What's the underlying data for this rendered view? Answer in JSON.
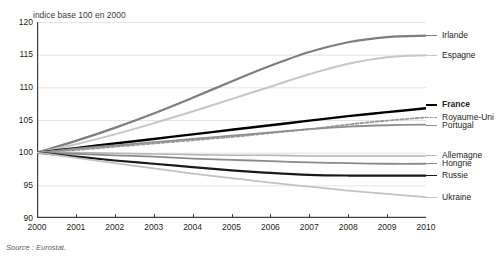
{
  "figure": {
    "title_sliver": "évolution comparée",
    "subtitle": "indice base 100 en 2000",
    "source": "Source : Eurostat."
  },
  "axes": {
    "y_ticks": [
      "120",
      "115",
      "110",
      "105",
      "100",
      "95",
      "90"
    ],
    "x_ticks": [
      "2000",
      "2001",
      "2002",
      "2003",
      "2004",
      "2005",
      "2006",
      "2007",
      "2008",
      "2009",
      "2010"
    ]
  },
  "chart_data": {
    "type": "line",
    "title": "",
    "subtitle": "indice base 100 en 2000",
    "xlabel": "",
    "ylabel": "indice base 100 en 2000",
    "xlim": [
      2000,
      2010
    ],
    "ylim": [
      90,
      120
    ],
    "y_ticks": [
      120,
      115,
      110,
      105,
      100,
      95,
      90
    ],
    "grid": "horizontal",
    "legend_position": "right-inline",
    "x": [
      2000,
      2001,
      2002,
      2003,
      2004,
      2005,
      2006,
      2007,
      2008,
      2009,
      2010
    ],
    "series": [
      {
        "name": "Irlande",
        "color": "#7d7d80",
        "width": 2.2,
        "dash": "none",
        "label_y": 118.0,
        "values": [
          100.0,
          101.8,
          103.8,
          106.0,
          108.4,
          110.9,
          113.3,
          115.4,
          116.9,
          117.7,
          117.9
        ]
      },
      {
        "name": "Espagne",
        "color": "#c6c6c8",
        "width": 2.0,
        "dash": "none",
        "label_y": 114.9,
        "values": [
          100.0,
          101.3,
          102.8,
          104.5,
          106.3,
          108.2,
          110.1,
          112.0,
          113.6,
          114.6,
          114.9
        ]
      },
      {
        "name": "France",
        "color": "#000000",
        "width": 2.4,
        "dash": "none",
        "label_y": 107.3,
        "bold_label": true,
        "values": [
          100.0,
          100.7,
          101.4,
          102.1,
          102.8,
          103.5,
          104.2,
          104.9,
          105.6,
          106.2,
          106.8
        ]
      },
      {
        "name": "Royaume-Uni",
        "color": "#9a9a9d",
        "width": 1.8,
        "dash": "3,2",
        "label_y": 105.4,
        "values": [
          100.0,
          100.4,
          100.9,
          101.4,
          101.9,
          102.4,
          103.0,
          103.6,
          104.3,
          104.9,
          105.4
        ]
      },
      {
        "name": "Portugal",
        "color": "#8f8f92",
        "width": 1.8,
        "dash": "none",
        "label_y": 104.2,
        "values": [
          100.0,
          100.6,
          101.1,
          101.6,
          102.1,
          102.6,
          103.1,
          103.6,
          104.0,
          104.2,
          104.3
        ]
      },
      {
        "name": "Allemagne",
        "color": "#b5b5b8",
        "width": 1.6,
        "dash": "none",
        "label_y": 99.5,
        "values": [
          100.0,
          100.0,
          99.9,
          99.8,
          99.7,
          99.6,
          99.6,
          99.5,
          99.5,
          99.5,
          99.5
        ]
      },
      {
        "name": "Hongrie",
        "color": "#8a8a8d",
        "width": 1.8,
        "dash": "none",
        "label_y": 98.3,
        "values": [
          100.0,
          99.8,
          99.6,
          99.4,
          99.1,
          98.9,
          98.7,
          98.5,
          98.4,
          98.3,
          98.3
        ]
      },
      {
        "name": "Russie",
        "color": "#1a1a1a",
        "width": 2.2,
        "dash": "none",
        "label_y": 96.5,
        "values": [
          100.0,
          99.4,
          98.8,
          98.3,
          97.8,
          97.3,
          96.9,
          96.6,
          96.5,
          96.5,
          96.5
        ]
      },
      {
        "name": "Ukraine",
        "color": "#c2c2c4",
        "width": 1.8,
        "dash": "none",
        "label_y": 93.2,
        "values": [
          100.0,
          99.2,
          98.4,
          97.6,
          96.8,
          96.1,
          95.4,
          94.8,
          94.2,
          93.7,
          93.2
        ]
      }
    ]
  },
  "colors": {
    "axis": "#3f3f41",
    "grid": "#e3e3e5",
    "text": "#231f20"
  }
}
